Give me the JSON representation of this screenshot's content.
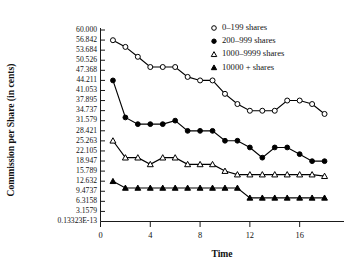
{
  "chart_data": {
    "type": "line",
    "title": "",
    "xlabel": "Time",
    "ylabel": "Commission per Share (in cents)",
    "xlim": [
      0,
      19
    ],
    "ylim": [
      0,
      60
    ],
    "grid": false,
    "legend_position": "top-right",
    "xticks": [
      0,
      4,
      8,
      12,
      16
    ],
    "xtick_labels": [
      "0",
      "4",
      "8",
      "12",
      "16"
    ],
    "ytick_labels": [
      "60.000",
      "56.842",
      "53.684",
      "50.526",
      "47.368",
      "44.211",
      "41.053",
      "37.895",
      "34.737",
      "31.579",
      "28.421",
      "25.263",
      "22.105",
      "18.947",
      "15.789",
      "12.632",
      "9.4737",
      "6.3158",
      "3.1579",
      "0.13323E-13"
    ],
    "ytick_values": [
      60.0,
      56.842,
      53.684,
      50.526,
      47.368,
      44.211,
      41.053,
      37.895,
      34.737,
      31.579,
      28.421,
      25.263,
      22.105,
      18.947,
      15.789,
      12.632,
      9.4737,
      6.3158,
      3.1579,
      0.0
    ],
    "x": [
      1,
      2,
      3,
      4,
      5,
      6,
      7,
      8,
      9,
      10,
      11,
      12,
      13,
      14,
      15,
      16,
      17,
      18
    ],
    "series": [
      {
        "name": "0–199 shares",
        "marker": "open-circle",
        "values": [
          56.8,
          54.7,
          51.6,
          48.4,
          48.4,
          48.4,
          45.3,
          44.2,
          44.2,
          40.0,
          36.8,
          34.7,
          34.7,
          34.7,
          37.9,
          37.9,
          36.8,
          33.7
        ]
      },
      {
        "name": "200–999 shares",
        "marker": "filled-circle",
        "values": [
          44.2,
          32.6,
          30.5,
          30.5,
          30.5,
          31.6,
          28.4,
          28.4,
          28.4,
          25.3,
          25.3,
          23.2,
          20.0,
          23.2,
          23.2,
          21.1,
          18.9,
          18.9
        ]
      },
      {
        "name": "1000–9999 shares",
        "marker": "open-triangle",
        "values": [
          25.3,
          20.0,
          20.0,
          17.9,
          20.0,
          20.0,
          17.9,
          17.9,
          17.9,
          15.8,
          14.7,
          14.7,
          14.7,
          14.7,
          14.7,
          14.7,
          14.7,
          14.2
        ]
      },
      {
        "name": "10000 + shares",
        "marker": "filled-triangle",
        "values": [
          12.6,
          10.5,
          10.5,
          10.5,
          10.5,
          10.5,
          10.5,
          10.5,
          10.5,
          10.5,
          10.5,
          7.4,
          7.4,
          7.4,
          7.4,
          7.4,
          7.4,
          7.4
        ]
      }
    ]
  },
  "legend": {
    "items": [
      {
        "label": "0–199 shares",
        "marker": "open-circle"
      },
      {
        "label": "200–999 shares",
        "marker": "filled-circle"
      },
      {
        "label": "1000–9999 shares",
        "marker": "open-triangle"
      },
      {
        "label": "10000 + shares",
        "marker": "filled-triangle"
      }
    ]
  }
}
